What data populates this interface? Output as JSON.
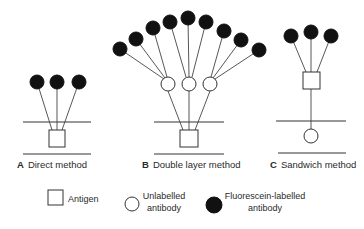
{
  "panels": [
    {
      "letter": "A",
      "title": "Direct method"
    },
    {
      "letter": "B",
      "title": "Double layer method"
    },
    {
      "letter": "C",
      "title": "Sandwich method"
    }
  ],
  "legend": {
    "antigen": "Antigen",
    "unlabelled_line1": "Unlabelled",
    "unlabelled_line2": "antibody",
    "fluorescein_line1": "Fluorescein-labelled",
    "fluorescein_line2": "antibody"
  },
  "colors": {
    "labelled_antibody": "#111111",
    "unlabelled_antibody": "#ffffff",
    "lines": "#333333"
  }
}
